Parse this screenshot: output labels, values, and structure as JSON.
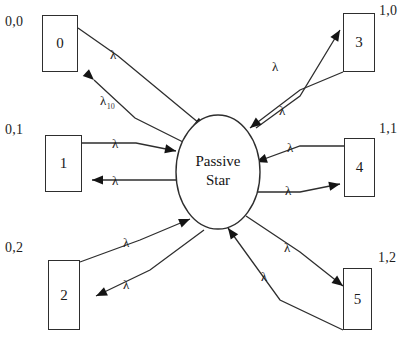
{
  "diagram": {
    "hub": {
      "name": "passive-star-hub",
      "label": "Passive\nStar",
      "cx": 218,
      "cy": 172,
      "rx": 42,
      "ry": 57
    },
    "stroke_color": "#2e2e2e",
    "text_color": "#1a1a1a",
    "background": "#ffffff",
    "nodes": [
      {
        "id": "0",
        "label": "0",
        "coord": "0,0",
        "x": 42,
        "y": 15,
        "w": 36,
        "h": 57,
        "coord_x": 5,
        "coord_y": 14
      },
      {
        "id": "1",
        "label": "1",
        "coord": "0,1",
        "x": 45,
        "y": 135,
        "w": 37,
        "h": 57,
        "coord_x": 5,
        "coord_y": 122
      },
      {
        "id": "2",
        "label": "2",
        "coord": "0,2",
        "x": 48,
        "y": 260,
        "w": 32,
        "h": 70,
        "coord_x": 5,
        "coord_y": 240
      },
      {
        "id": "3",
        "label": "3",
        "coord": "1,0",
        "x": 343,
        "y": 13,
        "w": 32,
        "h": 59,
        "coord_x": 379,
        "coord_y": 3
      },
      {
        "id": "4",
        "label": "4",
        "coord": "1,1",
        "x": 344,
        "y": 138,
        "w": 31,
        "h": 59,
        "coord_x": 379,
        "coord_y": 121
      },
      {
        "id": "5",
        "label": "5",
        "coord": "1,2",
        "x": 343,
        "y": 268,
        "w": 29,
        "h": 62,
        "coord_x": 378,
        "coord_y": 250
      }
    ],
    "link_labels": [
      {
        "name": "lambda-node0-out",
        "base": "λ",
        "sub": "",
        "x": 110,
        "y": 48
      },
      {
        "name": "lambda-node0-in",
        "base": "λ",
        "sub": "10",
        "x": 100,
        "y": 94
      },
      {
        "name": "lambda-node1-out",
        "base": "λ",
        "sub": "",
        "x": 112,
        "y": 137
      },
      {
        "name": "lambda-node1-in",
        "base": "λ",
        "sub": "",
        "x": 112,
        "y": 174
      },
      {
        "name": "lambda-node2-out",
        "base": "λ",
        "sub": "",
        "x": 123,
        "y": 236
      },
      {
        "name": "lambda-node2-in",
        "base": "λ",
        "sub": "",
        "x": 123,
        "y": 278
      },
      {
        "name": "lambda-node3-out",
        "base": "λ",
        "sub": "",
        "x": 272,
        "y": 60
      },
      {
        "name": "lambda-node3-in",
        "base": "λ",
        "sub": "",
        "x": 279,
        "y": 104
      },
      {
        "name": "lambda-node4-out",
        "base": "λ",
        "sub": "",
        "x": 287,
        "y": 141
      },
      {
        "name": "lambda-node4-in",
        "base": "λ",
        "sub": "",
        "x": 285,
        "y": 184
      },
      {
        "name": "lambda-node5-out",
        "base": "λ",
        "sub": "",
        "x": 284,
        "y": 241
      },
      {
        "name": "lambda-node5-in",
        "base": "λ",
        "sub": "",
        "x": 261,
        "y": 270
      }
    ],
    "links": [
      {
        "name": "link-node0-to-hub",
        "from": "0",
        "to": "hub",
        "arrow_at": "hub",
        "path": "M 78 28 L 118 56 L 205 128",
        "head": "205,128,0.64"
      },
      {
        "name": "link-hub-to-node0",
        "from": "hub",
        "to": "0",
        "arrow_at": "node",
        "path": "M 183 142 L 135 118 L 94 80",
        "head": "94,80,0.74"
      },
      {
        "name": "link-node1-to-hub",
        "from": "1",
        "to": "hub",
        "arrow_at": "hub",
        "path": "M 82 143 L 136 143 L 176 151",
        "head": "176,151,0.20"
      },
      {
        "name": "link-hub-to-node1",
        "from": "hub",
        "to": "1",
        "arrow_at": "node",
        "path": "M 178 180 L 136 180 L 92 180",
        "head": "92,180,3.14"
      },
      {
        "name": "link-node2-to-hub",
        "from": "2",
        "to": "hub",
        "arrow_at": "hub",
        "path": "M 80 262 L 140 240 L 190 219",
        "head": "190,219,-0.40"
      },
      {
        "name": "link-hub-to-node2",
        "from": "hub",
        "to": "2",
        "arrow_at": "node",
        "path": "M 204 230 L 150 270 L 96 296",
        "head": "96,296,2.70"
      },
      {
        "name": "link-node3-to-hub",
        "from": "3",
        "to": "hub",
        "arrow_at": "hub",
        "path": "M 343 72 L 300 90 L 250 128",
        "head": "250,128,2.48"
      },
      {
        "name": "link-hub-to-node3",
        "from": "hub",
        "to": "3",
        "arrow_at": "node",
        "path": "M 256 128 L 300 96 L 340 30",
        "head": "340,30,-1.03"
      },
      {
        "name": "link-node4-to-hub",
        "from": "4",
        "to": "hub",
        "arrow_at": "hub",
        "path": "M 344 146 L 300 146 L 256 162",
        "head": "256,162,2.80"
      },
      {
        "name": "link-hub-to-node4",
        "from": "hub",
        "to": "4",
        "arrow_at": "node",
        "path": "M 258 192 L 300 192 L 340 184",
        "head": "340,184,-0.20"
      },
      {
        "name": "link-node5-to-hub",
        "from": "5",
        "to": "hub",
        "arrow_at": "hub",
        "path": "M 343 330 L 280 300 L 228 228",
        "head": "228,228,-2.20"
      },
      {
        "name": "link-hub-to-node5",
        "from": "hub",
        "to": "5",
        "arrow_at": "node",
        "path": "M 246 216 L 300 252 L 343 286",
        "head": "343,286,0.66"
      }
    ]
  }
}
